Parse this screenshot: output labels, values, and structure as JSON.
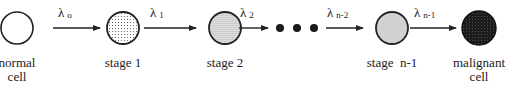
{
  "diagram": {
    "type": "multistage-carcinogenesis-chain",
    "nodes": [
      {
        "id": "normal",
        "label_line1": "normal",
        "label_line2": "cell",
        "fill": "none"
      },
      {
        "id": "stage1",
        "label_line1": "stage 1",
        "label_line2": "",
        "fill": "sparse-dots"
      },
      {
        "id": "stage2",
        "label_line1": "stage 2",
        "label_line2": "",
        "fill": "dense-dots"
      },
      {
        "id": "stage_n_minus_1",
        "label_line1": "stage  n-1",
        "label_line2": "",
        "fill": "light-gray-dots"
      },
      {
        "id": "malignant",
        "label_line1": "malignant",
        "label_line2": "cell",
        "fill": "dark-crosshatch"
      }
    ],
    "transitions": [
      {
        "symbol": "λ",
        "subscript": "o"
      },
      {
        "symbol": "λ",
        "subscript": "1"
      },
      {
        "symbol": "λ",
        "subscript": "2"
      },
      {
        "symbol": "λ",
        "subscript": "n-2"
      },
      {
        "symbol": "λ",
        "subscript": "n-1"
      }
    ],
    "ellipsis": "● ● ●"
  }
}
